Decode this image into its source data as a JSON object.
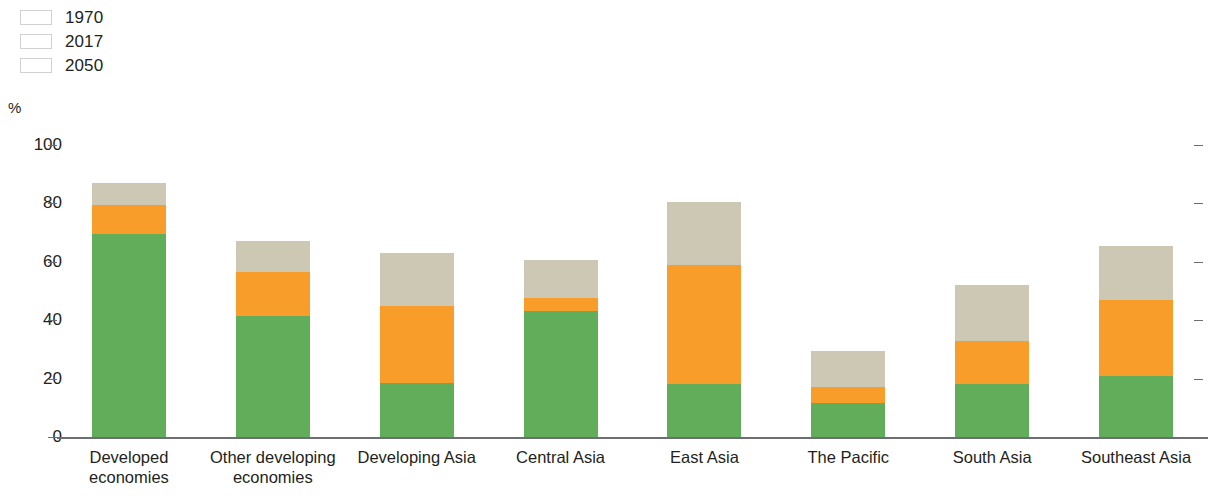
{
  "legend": {
    "position": "top-left",
    "items": [
      {
        "label": "1970",
        "color": "#61ad5a",
        "icon": "color-swatch-icon"
      },
      {
        "label": "2017",
        "color": "#f99d2a",
        "icon": "color-swatch-icon"
      },
      {
        "label": "2050",
        "color": "#cdc8b4",
        "icon": "color-swatch-icon"
      }
    ]
  },
  "axis": {
    "unit_label": "%",
    "y_ticks": [
      "100",
      "80",
      "60",
      "40",
      "20",
      "0"
    ]
  },
  "chart_data": {
    "type": "bar",
    "title": "",
    "subtitle": "",
    "xlabel": "",
    "ylabel": "%",
    "ylim": [
      0,
      100
    ],
    "yticks": [
      0,
      20,
      40,
      60,
      80,
      100
    ],
    "grid": false,
    "legend_position": "top-left",
    "stacked_appearance": true,
    "note": "Bars are drawn overlaid: 2050 is the tallest/back segment, 2017 middle, 1970 front. Values are absolute percentages, not cumulative.",
    "categories": [
      "Developed\neconomies",
      "Other developing\neconomies",
      "Developing Asia",
      "Central Asia",
      "East Asia",
      "The Pacific",
      "South Asia",
      "Southeast Asia"
    ],
    "series": [
      {
        "name": "1970",
        "color": "#61ad5a",
        "values": [
          69.5,
          41.5,
          18.5,
          43,
          18,
          11.5,
          18,
          21
        ]
      },
      {
        "name": "2017",
        "color": "#f99d2a",
        "values": [
          79.5,
          56.5,
          45,
          47.5,
          59,
          17,
          33,
          47
        ]
      },
      {
        "name": "2050",
        "color": "#cdc8b4",
        "values": [
          87,
          67,
          63,
          60.5,
          80.5,
          29.5,
          52,
          65.5
        ]
      }
    ]
  }
}
